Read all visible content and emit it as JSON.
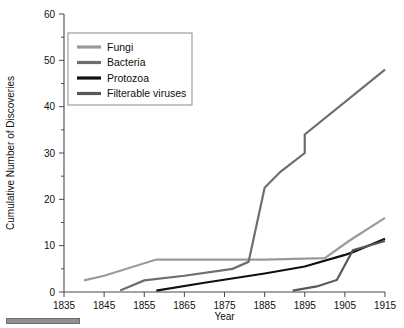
{
  "chart_data": {
    "type": "line",
    "title": "",
    "xlabel": "Year",
    "ylabel": "Cumulative Number of Discoveries",
    "xlim": [
      1835,
      1915
    ],
    "ylim": [
      0,
      60
    ],
    "xticks": [
      1835,
      1845,
      1855,
      1865,
      1875,
      1885,
      1895,
      1905,
      1915
    ],
    "xtick_labels": [
      "1835",
      "1845",
      "1855",
      "1865",
      "1875",
      "1885",
      "1895",
      "1905",
      "1915"
    ],
    "yticks": [
      0,
      10,
      20,
      30,
      40,
      50,
      60
    ],
    "ytick_labels": [
      "0",
      "10",
      "20",
      "30",
      "40",
      "50",
      "60"
    ],
    "yminor_ticks": [
      5,
      15,
      25,
      35,
      45,
      55
    ],
    "grid": false,
    "legend_position": "upper-left-inside",
    "series": [
      {
        "name": "Fungi",
        "color": "#9a9a9a",
        "points": [
          [
            1840,
            2.5
          ],
          [
            1845,
            3.5
          ],
          [
            1858,
            7.0
          ],
          [
            1875,
            7.0
          ],
          [
            1885,
            7.0
          ],
          [
            1900,
            7.3
          ],
          [
            1906,
            11.0
          ],
          [
            1915,
            16.0
          ]
        ]
      },
      {
        "name": "Bacteria",
        "color": "#6e6e6e",
        "points": [
          [
            1849,
            0.3
          ],
          [
            1855,
            2.5
          ],
          [
            1865,
            3.5
          ],
          [
            1877,
            5.0
          ],
          [
            1881,
            6.5
          ],
          [
            1885,
            22.5
          ],
          [
            1889,
            26.0
          ],
          [
            1895,
            30.0
          ],
          [
            1895,
            34.0
          ],
          [
            1915,
            48.0
          ]
        ]
      },
      {
        "name": "Protozoa",
        "color": "#101010",
        "points": [
          [
            1858,
            0.3
          ],
          [
            1870,
            2.0
          ],
          [
            1885,
            4.0
          ],
          [
            1895,
            5.5
          ],
          [
            1905,
            8.0
          ],
          [
            1907,
            8.6
          ],
          [
            1915,
            11.5
          ]
        ]
      },
      {
        "name": "Filterable viruses",
        "color": "#585858",
        "points": [
          [
            1892,
            0.3
          ],
          [
            1898,
            1.2
          ],
          [
            1903,
            2.6
          ],
          [
            1907,
            9.0
          ],
          [
            1915,
            11.0
          ]
        ]
      }
    ]
  },
  "legend": {
    "items": [
      {
        "label": "Fungi",
        "color": "#9a9a9a"
      },
      {
        "label": "Bacteria",
        "color": "#6e6e6e"
      },
      {
        "label": "Protozoa",
        "color": "#101010"
      },
      {
        "label": "Filterable viruses",
        "color": "#585858"
      }
    ]
  }
}
